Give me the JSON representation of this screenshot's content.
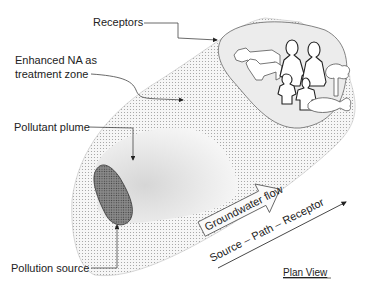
{
  "diagram": {
    "type": "conceptual plan view",
    "labels": {
      "receptors": "Receptors",
      "treatment_zone_line1": "Enhanced NA as",
      "treatment_zone_line2": "treatment zone",
      "pollutant_plume": "Pollutant plume",
      "pollution_source": "Pollution source",
      "groundwater_flow": "Groundwater flow",
      "source_path_receptor": "Source – Path – Receptor",
      "view": "Plan View"
    },
    "receptor_icons": [
      "cow-icon",
      "calf-icon",
      "adult-person-icon",
      "adult-person-icon",
      "child-icon",
      "child-icon",
      "tree-icon",
      "fish-icon"
    ],
    "colors": {
      "treatment_zone_dots": "#9a9a9a",
      "receptor_zone_fill": "#ececec",
      "plume_fill": "#e2e2e2",
      "source_fill": "#6e6e6e",
      "outline": "#555555",
      "text": "#222222"
    }
  }
}
